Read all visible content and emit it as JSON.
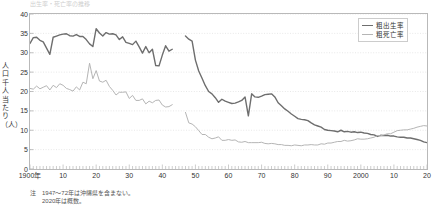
{
  "figure": {
    "title_cut": "出生率・死亡率の推移",
    "y_axis_title": "人口千人当たり（人）"
  },
  "legend": {
    "position": "top-right",
    "items": [
      {
        "name": "birth-rate",
        "label": "粗出生率",
        "color": "#6e6e6e"
      },
      {
        "name": "death-rate",
        "label": "粗死亡率",
        "color": "#b5b5b5"
      }
    ]
  },
  "note": {
    "mark": "注",
    "lines": [
      "1947～72年は沖縄県を含まない。",
      "2020年は概数。"
    ]
  },
  "chart_data": {
    "type": "line",
    "title": "出生率・死亡率の推移",
    "xlabel": "",
    "ylabel": "人口千人当たり（人）",
    "xlim": [
      1900,
      2020
    ],
    "ylim": [
      0,
      40
    ],
    "ytick_step": 5,
    "yticks": [
      0,
      5,
      10,
      15,
      20,
      25,
      30,
      35,
      40
    ],
    "xticks": [
      1900,
      1910,
      1920,
      1930,
      1940,
      1950,
      1960,
      1970,
      1980,
      1990,
      2000,
      2010,
      2020
    ],
    "xtick_labels": [
      "1900年",
      "10",
      "20",
      "30",
      "40",
      "50",
      "60",
      "70",
      "80",
      "90",
      "2000",
      "10",
      "20"
    ],
    "grid": "horizontal-dotted",
    "minor_ticks": "yearly",
    "gap_years": [
      1944,
      1945,
      1946
    ],
    "series": [
      {
        "name": "粗出生率",
        "color": "#6e6e6e",
        "width": 1.4,
        "x": [
          1900,
          1901,
          1902,
          1903,
          1904,
          1905,
          1906,
          1907,
          1908,
          1909,
          1910,
          1911,
          1912,
          1913,
          1914,
          1915,
          1916,
          1917,
          1918,
          1919,
          1920,
          1921,
          1922,
          1923,
          1924,
          1925,
          1926,
          1927,
          1928,
          1929,
          1930,
          1931,
          1932,
          1933,
          1934,
          1935,
          1936,
          1937,
          1938,
          1939,
          1940,
          1941,
          1942,
          1943,
          1947,
          1948,
          1949,
          1950,
          1951,
          1952,
          1953,
          1954,
          1955,
          1956,
          1957,
          1958,
          1959,
          1960,
          1961,
          1962,
          1963,
          1964,
          1965,
          1966,
          1967,
          1968,
          1969,
          1970,
          1971,
          1972,
          1973,
          1974,
          1975,
          1976,
          1977,
          1978,
          1979,
          1980,
          1981,
          1982,
          1983,
          1984,
          1985,
          1986,
          1987,
          1988,
          1989,
          1990,
          1991,
          1992,
          1993,
          1994,
          1995,
          1996,
          1997,
          1998,
          1999,
          2000,
          2001,
          2002,
          2003,
          2004,
          2005,
          2006,
          2007,
          2008,
          2009,
          2010,
          2011,
          2012,
          2013,
          2014,
          2015,
          2016,
          2017,
          2018,
          2019,
          2020
        ],
        "y": [
          32.4,
          33.9,
          34.0,
          33.2,
          32.8,
          31.2,
          29.6,
          34.0,
          34.3,
          34.6,
          34.8,
          34.9,
          34.4,
          34.3,
          34.7,
          34.2,
          34.2,
          33.4,
          32.3,
          31.6,
          36.2,
          35.1,
          34.3,
          35.2,
          34.8,
          34.9,
          34.6,
          33.4,
          34.1,
          32.7,
          32.4,
          32.1,
          33.0,
          31.5,
          29.9,
          31.6,
          30.0,
          30.9,
          26.7,
          26.6,
          29.4,
          31.8,
          30.4,
          30.9,
          34.3,
          33.5,
          33.0,
          28.1,
          25.3,
          23.4,
          21.5,
          20.0,
          19.4,
          18.4,
          17.2,
          18.0,
          17.5,
          17.2,
          16.9,
          17.0,
          17.3,
          17.7,
          18.6,
          13.7,
          19.4,
          18.6,
          18.5,
          18.8,
          19.2,
          19.3,
          19.4,
          18.6,
          17.1,
          16.3,
          15.5,
          14.9,
          14.2,
          13.6,
          13.0,
          12.8,
          12.7,
          12.5,
          11.9,
          11.4,
          11.1,
          10.8,
          10.2,
          10.0,
          9.9,
          9.8,
          9.6,
          10.0,
          9.6,
          9.7,
          9.5,
          9.6,
          9.4,
          9.5,
          9.3,
          9.2,
          8.9,
          8.8,
          8.4,
          8.7,
          8.6,
          8.7,
          8.5,
          8.5,
          8.3,
          8.2,
          8.2,
          8.0,
          8.0,
          7.8,
          7.6,
          7.4,
          7.0,
          6.8
        ]
      },
      {
        "name": "粗死亡率",
        "color": "#b5b5b5",
        "width": 1.0,
        "x": [
          1900,
          1901,
          1902,
          1903,
          1904,
          1905,
          1906,
          1907,
          1908,
          1909,
          1910,
          1911,
          1912,
          1913,
          1914,
          1915,
          1916,
          1917,
          1918,
          1919,
          1920,
          1921,
          1922,
          1923,
          1924,
          1925,
          1926,
          1927,
          1928,
          1929,
          1930,
          1931,
          1932,
          1933,
          1934,
          1935,
          1936,
          1937,
          1938,
          1939,
          1940,
          1941,
          1942,
          1943,
          1947,
          1948,
          1949,
          1950,
          1951,
          1952,
          1953,
          1954,
          1955,
          1956,
          1957,
          1958,
          1959,
          1960,
          1961,
          1962,
          1963,
          1964,
          1965,
          1966,
          1967,
          1968,
          1969,
          1970,
          1971,
          1972,
          1973,
          1974,
          1975,
          1976,
          1977,
          1978,
          1979,
          1980,
          1981,
          1982,
          1983,
          1984,
          1985,
          1986,
          1987,
          1988,
          1989,
          1990,
          1991,
          1992,
          1993,
          1994,
          1995,
          1996,
          1997,
          1998,
          1999,
          2000,
          2001,
          2002,
          2003,
          2004,
          2005,
          2006,
          2007,
          2008,
          2009,
          2010,
          2011,
          2012,
          2013,
          2014,
          2015,
          2016,
          2017,
          2018,
          2019,
          2020
        ],
        "y": [
          20.8,
          20.6,
          21.4,
          20.7,
          21.1,
          21.5,
          20.4,
          21.6,
          21.0,
          22.0,
          21.6,
          20.8,
          20.5,
          20.1,
          21.2,
          20.4,
          22.4,
          22.0,
          27.3,
          23.3,
          25.4,
          22.7,
          22.4,
          22.9,
          21.3,
          20.3,
          19.1,
          19.8,
          19.8,
          19.9,
          18.2,
          19.0,
          17.7,
          17.7,
          18.1,
          16.8,
          17.5,
          17.1,
          17.7,
          17.8,
          16.5,
          16.0,
          16.1,
          16.6,
          14.6,
          11.9,
          11.6,
          10.9,
          9.9,
          8.9,
          8.9,
          8.2,
          7.8,
          8.0,
          8.3,
          7.4,
          7.4,
          7.6,
          7.4,
          7.5,
          7.0,
          6.9,
          7.1,
          6.8,
          6.8,
          6.8,
          6.8,
          6.9,
          6.6,
          6.5,
          6.6,
          6.5,
          6.3,
          6.3,
          6.1,
          6.1,
          6.0,
          6.2,
          6.1,
          6.0,
          6.2,
          6.2,
          6.3,
          6.2,
          6.2,
          6.5,
          6.4,
          6.7,
          6.7,
          6.9,
          7.1,
          7.1,
          7.4,
          7.2,
          7.3,
          7.5,
          7.8,
          7.7,
          7.7,
          7.8,
          8.0,
          8.2,
          8.6,
          8.6,
          8.8,
          9.1,
          9.1,
          9.5,
          9.9,
          10.0,
          10.1,
          10.1,
          10.3,
          10.5,
          10.8,
          11.0,
          11.2,
          11.1
        ]
      }
    ]
  }
}
